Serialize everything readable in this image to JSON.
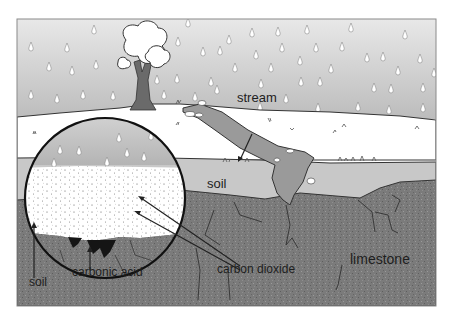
{
  "diagram": {
    "title": "",
    "colors": {
      "sky_top": "#e6e6e6",
      "sky_bottom": "#bdbdbd",
      "ground_surface": "#ffffff",
      "soil": "#c8c8c8",
      "stream": "#9a9a9a",
      "limestone": "#7c7c7c",
      "outline": "#1a1a1a",
      "carbonic_acid": "#151515",
      "tree_trunk": "#6a6a6a"
    },
    "labels": {
      "stream": "stream",
      "soil_main": "soil",
      "soil_inset": "soil",
      "carbonic_acid": "carbonic acid",
      "carbon_dioxide": "carbon dioxide",
      "limestone": "limestone"
    },
    "layers": [
      "rain / sky",
      "ground surface",
      "soil",
      "limestone"
    ],
    "inset": {
      "shape": "magnified circle",
      "contents": [
        "rain",
        "soil with carbon dioxide particles",
        "carbonic acid",
        "limestone"
      ]
    }
  }
}
